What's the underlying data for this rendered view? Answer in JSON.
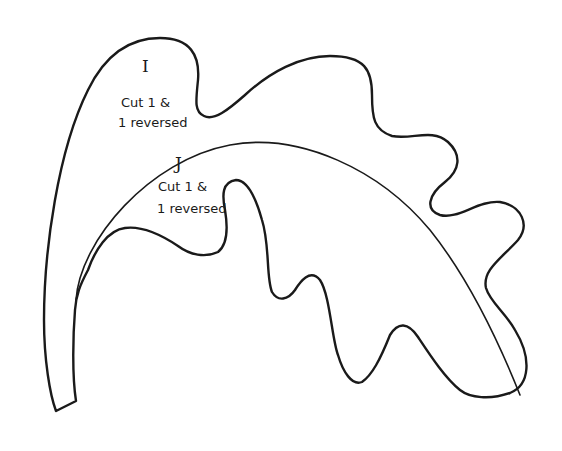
{
  "pattern": {
    "stroke_color": "#1a1a1a",
    "background": "#ffffff",
    "pieces": [
      {
        "letter": "I",
        "instruction_line1": "Cut 1 &",
        "instruction_line2": "1 reversed"
      },
      {
        "letter": "J",
        "instruction_line1": "Cut 1 &",
        "instruction_line2": "1 reversed"
      }
    ]
  }
}
